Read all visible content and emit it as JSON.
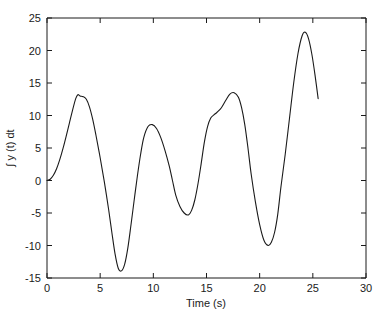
{
  "chart_data": {
    "type": "line",
    "title": "",
    "xlabel": "Time (s)",
    "ylabel": "∫ y (t) dt",
    "xlim": [
      0,
      30
    ],
    "ylim": [
      -15,
      25
    ],
    "xticks": [
      0,
      5,
      10,
      15,
      20,
      25,
      30
    ],
    "xtick_labels": [
      "0",
      "5",
      "10",
      "15",
      "20",
      "25",
      "30"
    ],
    "yticks": [
      -15,
      -10,
      -5,
      0,
      5,
      10,
      15,
      20,
      25
    ],
    "ytick_labels": [
      "-15",
      "-10",
      "-5",
      "0",
      "5",
      "10",
      "15",
      "20",
      "25"
    ],
    "grid": false,
    "legend": null,
    "line_color": "#1a1a1a",
    "background_color": "#ffffff",
    "series": [
      {
        "name": "integral of y(t)",
        "x": [
          0.0,
          0.3,
          0.6,
          0.9,
          1.2,
          1.5,
          1.8,
          2.1,
          2.4,
          2.7,
          2.9,
          3.1,
          3.4,
          3.7,
          4.0,
          4.3,
          4.6,
          5.0,
          5.4,
          5.8,
          6.1,
          6.4,
          6.7,
          7.0,
          7.3,
          7.6,
          7.9,
          8.2,
          8.5,
          8.8,
          9.1,
          9.5,
          9.9,
          10.3,
          10.7,
          11.1,
          11.5,
          11.8,
          12.1,
          12.5,
          12.9,
          13.3,
          13.6,
          13.9,
          14.2,
          14.5,
          14.8,
          15.1,
          15.4,
          15.7,
          16.0,
          16.4,
          16.8,
          17.2,
          17.6,
          18.0,
          18.3,
          18.6,
          18.9,
          19.2,
          19.6,
          20.0,
          20.4,
          20.8,
          21.1,
          21.4,
          21.7,
          22.0,
          22.4,
          22.8,
          23.2,
          23.6,
          24.0,
          24.3,
          24.6,
          24.9,
          25.2,
          25.5
        ],
        "y": [
          0.0,
          0.2,
          0.8,
          1.8,
          3.2,
          4.9,
          6.8,
          8.8,
          10.8,
          12.6,
          13.2,
          13.0,
          12.9,
          12.5,
          11.3,
          9.4,
          7.0,
          3.5,
          -0.3,
          -4.5,
          -8.0,
          -11.3,
          -13.5,
          -13.9,
          -12.9,
          -10.4,
          -6.8,
          -3.0,
          0.7,
          4.0,
          6.6,
          8.3,
          8.6,
          8.0,
          6.6,
          4.6,
          2.2,
          0.0,
          -2.2,
          -4.0,
          -5.0,
          -5.3,
          -4.6,
          -3.0,
          -0.5,
          2.6,
          5.9,
          8.3,
          9.6,
          10.1,
          10.5,
          11.2,
          12.3,
          13.3,
          13.5,
          12.8,
          11.2,
          8.6,
          5.0,
          1.0,
          -3.3,
          -6.8,
          -9.2,
          -10.0,
          -9.5,
          -8.0,
          -5.2,
          -1.0,
          4.0,
          9.5,
          15.0,
          19.5,
          22.3,
          22.8,
          21.8,
          19.5,
          16.3,
          12.6
        ]
      }
    ],
    "notes": {
      "curve_start_value": 0.0,
      "curve_end_time": 25.5,
      "curve_end_value": -0.5,
      "global_max": 22.8,
      "global_max_time": 21.4,
      "global_min": -13.9,
      "global_min_time": 6.4
    }
  },
  "axes": {
    "x_axis_label": "Time (s)",
    "y_axis_label": "∫ y (t) dt"
  }
}
